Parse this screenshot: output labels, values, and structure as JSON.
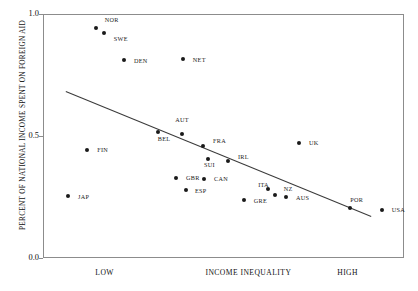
{
  "chart_data": {
    "type": "scatter",
    "title": "",
    "xlabel": "INCOME INEQUALITY",
    "ylabel": "PERCENT OF NATIONAL INCOME SPENT ON FOREIGN AID",
    "ylim": [
      0.0,
      1.0
    ],
    "yticks": [
      "0.0",
      "0.5",
      "1.0"
    ],
    "ytick_values": [
      0.0,
      0.5,
      1.0
    ],
    "xtick_labels": [
      "LOW",
      "INCOME INEQUALITY",
      "HIGH"
    ],
    "grid": false,
    "legend": "none",
    "trendline": {
      "x0": 0.065,
      "y0": 0.685,
      "x1": 0.912,
      "y1": 0.172
    },
    "points": [
      {
        "label": "NOR",
        "x": 0.146,
        "y": 0.943,
        "lx": 0.171,
        "ly": 0.974
      },
      {
        "label": "SWE",
        "x": 0.168,
        "y": 0.922,
        "lx": 0.196,
        "ly": 0.896
      },
      {
        "label": "DEN",
        "x": 0.225,
        "y": 0.81,
        "lx": 0.252,
        "ly": 0.806
      },
      {
        "label": "NET",
        "x": 0.388,
        "y": 0.814,
        "lx": 0.415,
        "ly": 0.81
      },
      {
        "label": "AUT",
        "x": 0.385,
        "y": 0.508,
        "lx": 0.366,
        "ly": 0.566
      },
      {
        "label": "BEL",
        "x": 0.318,
        "y": 0.516,
        "lx": 0.318,
        "ly": 0.487
      },
      {
        "label": "FIN",
        "x": 0.122,
        "y": 0.442,
        "lx": 0.15,
        "ly": 0.442
      },
      {
        "label": "FRA",
        "x": 0.443,
        "y": 0.459,
        "lx": 0.471,
        "ly": 0.48
      },
      {
        "label": "SUI",
        "x": 0.457,
        "y": 0.406,
        "lx": 0.446,
        "ly": 0.38
      },
      {
        "label": "IRL",
        "x": 0.512,
        "y": 0.397,
        "lx": 0.54,
        "ly": 0.414
      },
      {
        "label": "UK",
        "x": 0.709,
        "y": 0.471,
        "lx": 0.737,
        "ly": 0.471
      },
      {
        "label": "GBR",
        "x": 0.368,
        "y": 0.327,
        "lx": 0.396,
        "ly": 0.327
      },
      {
        "label": "CAN",
        "x": 0.446,
        "y": 0.322,
        "lx": 0.474,
        "ly": 0.322
      },
      {
        "label": "ESP",
        "x": 0.396,
        "y": 0.278,
        "lx": 0.421,
        "ly": 0.275
      },
      {
        "label": "ITA",
        "x": 0.623,
        "y": 0.283,
        "lx": 0.596,
        "ly": 0.3
      },
      {
        "label": "NZ",
        "x": 0.643,
        "y": 0.258,
        "lx": 0.667,
        "ly": 0.283
      },
      {
        "label": "AUS",
        "x": 0.673,
        "y": 0.25,
        "lx": 0.701,
        "ly": 0.246
      },
      {
        "label": "GRE",
        "x": 0.556,
        "y": 0.238,
        "lx": 0.584,
        "ly": 0.233
      },
      {
        "label": "POR",
        "x": 0.851,
        "y": 0.205,
        "lx": 0.851,
        "ly": 0.238
      },
      {
        "label": "USA",
        "x": 0.939,
        "y": 0.197,
        "lx": 0.966,
        "ly": 0.197
      },
      {
        "label": "JAP",
        "x": 0.069,
        "y": 0.255,
        "lx": 0.097,
        "ly": 0.25
      }
    ]
  }
}
